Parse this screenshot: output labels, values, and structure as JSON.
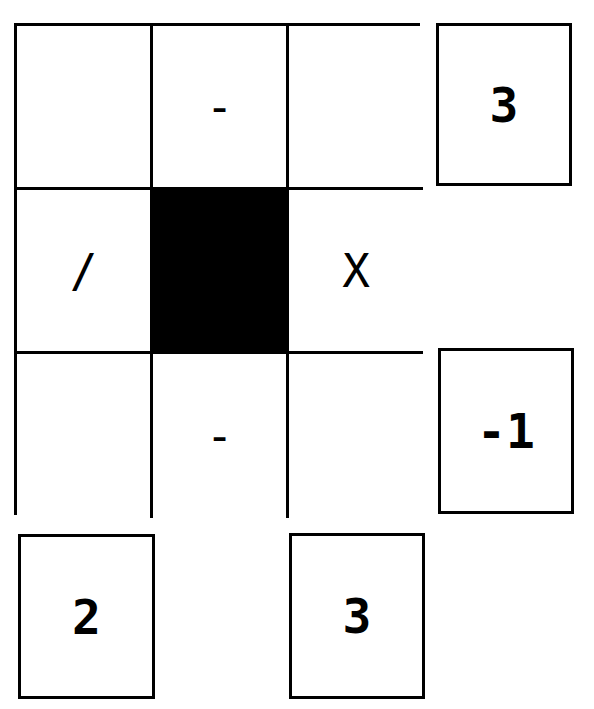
{
  "puzzle": {
    "grid": [
      [
        "",
        "-",
        ""
      ],
      [
        "/",
        "",
        "X"
      ],
      [
        "",
        "-",
        ""
      ]
    ],
    "black_cells": [
      [
        1,
        1
      ]
    ],
    "row_results": [
      {
        "row": 0,
        "value": "3"
      },
      {
        "row": 2,
        "value": "-1"
      }
    ],
    "column_results": [
      {
        "column": 0,
        "value": "2"
      },
      {
        "column": 2,
        "value": "3"
      }
    ],
    "colors": {
      "line": "#000000",
      "background": "#ffffff",
      "blocked": "#000000"
    }
  }
}
